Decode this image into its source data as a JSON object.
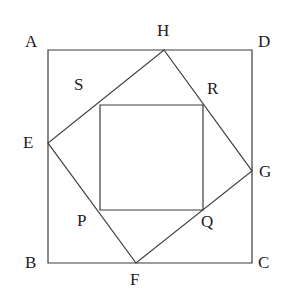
{
  "figure": {
    "background_color": "#ffffff",
    "stroke_color": "#3a3a3a",
    "label_color": "#1c1c1c",
    "stroke_width": 1.2,
    "canvas": {
      "width": 299,
      "height": 305
    }
  },
  "shapes": [
    {
      "name": "outer-square",
      "label": "ABCD",
      "points": "48,50 252,50 252,263 48,263",
      "closed": true
    },
    {
      "name": "middle-tilted-square",
      "label": "EFGH",
      "points": "164,50 252,171 136,263 48,143",
      "closed": true
    },
    {
      "name": "inner-square",
      "label": "SRQP",
      "points": "100,105 203,105 203,210 100,210",
      "closed": true
    }
  ],
  "vertices": [
    {
      "name": "A",
      "label": "A",
      "x": 48,
      "y": 50,
      "label_x": 25,
      "label_y": 33
    },
    {
      "name": "D",
      "label": "D",
      "x": 252,
      "y": 50,
      "label_x": 258,
      "label_y": 33
    },
    {
      "name": "B",
      "label": "B",
      "x": 48,
      "y": 263,
      "label_x": 25,
      "label_y": 254
    },
    {
      "name": "C",
      "label": "C",
      "x": 252,
      "y": 263,
      "label_x": 258,
      "label_y": 254
    },
    {
      "name": "H",
      "label": "H",
      "x": 164,
      "y": 50,
      "label_x": 157,
      "label_y": 22
    },
    {
      "name": "G",
      "label": "G",
      "x": 252,
      "y": 171,
      "label_x": 259,
      "label_y": 163
    },
    {
      "name": "F",
      "label": "F",
      "x": 136,
      "y": 263,
      "label_x": 130,
      "label_y": 271
    },
    {
      "name": "E",
      "label": "E",
      "x": 48,
      "y": 143,
      "label_x": 23,
      "label_y": 134
    },
    {
      "name": "S",
      "label": "S",
      "x": 100,
      "y": 105,
      "label_x": 74,
      "label_y": 76
    },
    {
      "name": "R",
      "label": "R",
      "x": 203,
      "y": 105,
      "label_x": 207,
      "label_y": 80
    },
    {
      "name": "P",
      "label": "P",
      "x": 100,
      "y": 210,
      "label_x": 77,
      "label_y": 212
    },
    {
      "name": "Q",
      "label": "Q",
      "x": 203,
      "y": 210,
      "label_x": 201,
      "label_y": 213
    }
  ]
}
